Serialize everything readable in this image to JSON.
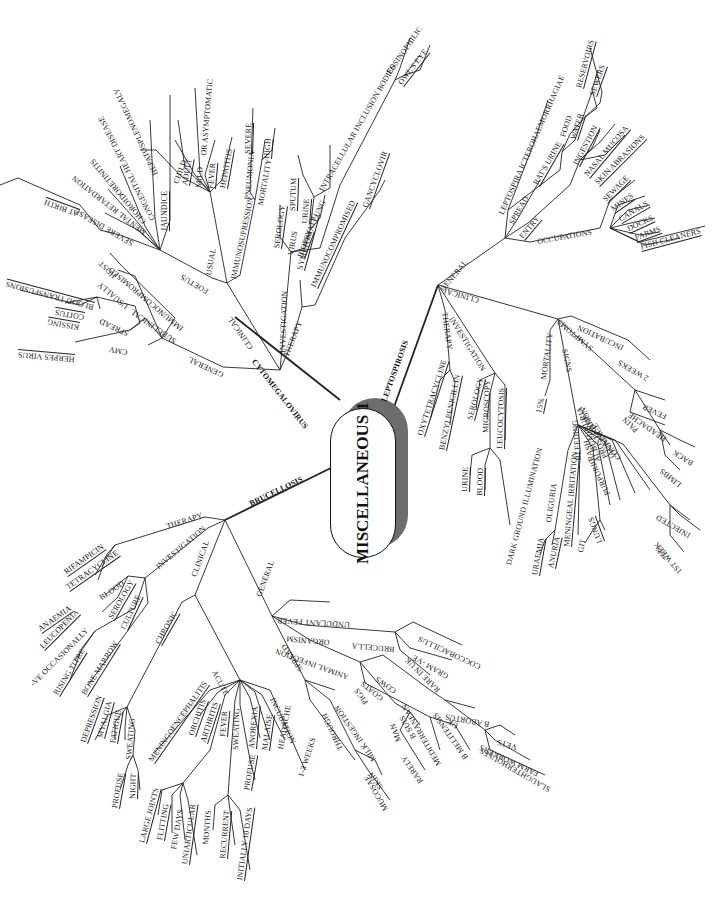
{
  "center": {
    "title": "MISCELLANEOUS 1"
  },
  "cytomegalovirus": {
    "label": "CYTOMEGALOVIRUS",
    "general": {
      "label": "GENERAL",
      "cmv": "CMV",
      "herpes_virus": "HERPES VIRUS",
      "spread": "SPREAD",
      "kissing": "KISSING",
      "coitus": "COITUS",
      "blood_transfusions": "BLOOD TRANSFUSIONS",
      "subclinical": "SUBCLINICAL",
      "usually": "USUALLY",
      "immunocompromised": "IMMUNOCOMPROMISED",
      "host": "HOST"
    },
    "clinical": {
      "label": "CLINICAL",
      "foetus": "FOETUS",
      "severe_disease": "SEVERE DISEASE",
      "at_birth": "AT BIRTH",
      "mental_retardation": "MENTAL RETARDATION",
      "choroidoretinitis": "CHOROIDORETINITIS",
      "congenital_heart_disease": "CONGENITAL HEART DISEASE",
      "jaundice": "JAUNDICE",
      "hepatosplenomegaly": "HEPATOSPLENOMEGALY",
      "usual": "USUAL",
      "child": "CHILD",
      "adult": "ADULT",
      "mild": "MILD",
      "or_asymptomatic": "OR ASYMPTOMATIC",
      "fever": "FEVER",
      "hepatitis": "HEPATITIS",
      "immunosupression": "IMMUNOSUPRESSION",
      "pneumonia": "PNEUMONIA",
      "severe": "SEVERE",
      "mortality": "MORTALITY",
      "high": "HIGH"
    },
    "investigation": {
      "label": "INVESTIGATION",
      "serology": "SEROLOGY",
      "virus": "VIRUS",
      "sputum": "SPUTUM",
      "urine": "URINE",
      "biopsy": "BIOPSY",
      "lung": "LUNG",
      "inclusion_bodies": "INTRACELLULAR INCLUSION BODIES",
      "eosinophilic": "EOSINOPHILIC",
      "owls_eye": "OWL'S EYE"
    },
    "therapy": {
      "label": "THERAPY",
      "symptomatic": "SYMPTOMATIC",
      "immunocompromised": "IMMUNOCOMPROMISED",
      "gancyclovir": "GANCYCLOVIR"
    }
  },
  "leptospirosis": {
    "label": "LEPTOSPIROSIS",
    "general": {
      "label": "GENERAL",
      "leptospira": "LEPTOSPIRA ICTEROHAEMORRHAGIAE",
      "spread": "SPREAD",
      "rats_urine": "RAT'S URINE",
      "food": "FOOD",
      "water": "WATER",
      "reservoirs": "RESERVOIRS",
      "sewers": "SEWERS",
      "entry": "ENTRY",
      "ingestion": "INGESTION",
      "nasal_mucosa": "NASAL MUCOSA",
      "skin_abrasions": "SKIN ABRASIONS",
      "occupations": "OCCUPATIONS",
      "sewage": "SEWAGE",
      "mines": "MINES",
      "canals": "CANALS",
      "docks": "DOCKS",
      "farms": "FARMS",
      "fish_cleaners": "FISH CLEANERS"
    },
    "clinical": {
      "label": "CLINICAL",
      "incubation": "INCUBATION",
      "two_weeks": "2 WEEKS",
      "symptoms": "SYMPTOMS",
      "fever": "FEVER",
      "headache": "HEADACHE",
      "pain": "PAIN",
      "back": "BACK",
      "limbs": "LIMBS",
      "mortality": "MORTALITY",
      "fifteen_pct": "15%",
      "signs": "SIGNS",
      "conjunctiva": "CONJUNCTIVA",
      "injected": "INJECTED",
      "pct_75": "75%",
      "first_week": "1ST WEEK",
      "jaundice": "JAUNDICE",
      "prostration": "PROSTRATION",
      "albuminuria": "ALBUMINURIA",
      "purpuric": "PURPURIC",
      "rash": "RASH",
      "bleeding": "BLEEDING",
      "git": "GIT",
      "lungs": "LUNGS",
      "meningeal_irritation": "MENINGEAL IRRITATION",
      "oliguria": "OLIGURIA",
      "uraemia": "URAEMIA",
      "anuria": "ANURIA"
    },
    "investigation": {
      "label": "INVESTIGATION",
      "serology": "SEROLOGY",
      "microscopy": "MICROSCOPY",
      "leucocytosis": "LEUCOCYTOSIS",
      "urine": "URINE",
      "blood": "BLOOD",
      "dark_ground": "DARK GROUND ILLUMINATION"
    },
    "therapy": {
      "label": "THERAPY",
      "oxytetracycline": "OXYTETRACYCLINE",
      "benzylpenicillin": "BENZYLPENICILLIN"
    }
  },
  "brucellosis": {
    "label": "BRUCELLOSIS",
    "therapy": {
      "label": "THERAPY",
      "rifampicin": "RIFAMPICIN",
      "tetracycline": "TETRACYCLINE"
    },
    "investigation": {
      "label": "INVESTIGATION",
      "blood": "BLOOD",
      "anaemia": "ANAEMIA",
      "leucopenia": "LEUCOPENIA",
      "serology": "SEROLOGY",
      "ve_occasionally": "-VE OCCASIONALLY",
      "rising_titre": "RISING TITRE",
      "culture": "CULTURE",
      "bone_marrow": "BONE MARROW"
    },
    "clinical": {
      "label": "CLINICAL",
      "chronic": "CHRONIC",
      "depression": "DEPRESSION",
      "myalgia": "MYALGIA",
      "fatigue": "FATIGUE",
      "sweating": "SWEATING",
      "profuse": "PROFUSE",
      "night": "NIGHT",
      "acute": "ACUTE",
      "meningoencephalitis": "MENINGOENCEPHALITIS",
      "orchitis": "ORCHITIS",
      "arthritis": "ARTHRITIS",
      "large_joints": "LARGE JOINTS",
      "flitting": "FLITTING",
      "few_days": "FEW DAYS",
      "uniarticular": "UNIARTICULAR",
      "fever": "FEVER",
      "months": "MONTHS",
      "recurrent": "RECURRENT",
      "initially_10_days": "INITIALLY 10 DAYS",
      "sweating2": "SWEATING",
      "profuse2": "PROFUSE",
      "anorexia": "ANOREXIA",
      "malaise": "MALAISE",
      "headache": "HEADACHE",
      "incubation": "INCUBATION",
      "weeks_1_3": "1-3 WEEKS"
    },
    "general": {
      "label": "GENERAL",
      "undulant_fever": "UNDULANT FEVER",
      "organism": "ORGANISM",
      "brucella": "BRUCELLA",
      "coccobacillus": "COCCOBACILLUS",
      "gram_ve": "GRAM -VE",
      "rare_in_uk": "RARE IN UK",
      "animal_infection": "ANIMAL INFECTION",
      "cows": "COWS",
      "b_abortus": "B ABORTUS",
      "uk": "UK",
      "vets": "VETS",
      "farm_workers": "FARM WORKERS",
      "slaughterhouses": "SLAUGHTERHOUSES",
      "goats": "GOATS",
      "b_melitensis": "B MELITENSIS",
      "mediterranean": "MEDITERRANEAN",
      "pigs": "PIGS",
      "b_suis": "B SUIS",
      "man": "MAN",
      "rarely": "RARELY",
      "spread": "SPREAD",
      "milk_ingestion": "MILK INGESTION",
      "through": "THROUGH",
      "skin": "SKIN",
      "mucosae": "MUCOSAE"
    }
  }
}
